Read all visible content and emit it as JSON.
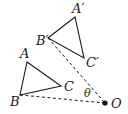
{
  "diagram": {
    "triangles": [
      {
        "name": "original",
        "vertices": [
          {
            "label": "A",
            "x": 27,
            "y": 62,
            "lx": 20,
            "ly": 58
          },
          {
            "label": "B",
            "x": 20,
            "y": 95,
            "lx": 10,
            "ly": 106
          },
          {
            "label": "C",
            "x": 61,
            "y": 86,
            "lx": 64,
            "ly": 91
          }
        ]
      },
      {
        "name": "image",
        "vertices": [
          {
            "label": "A′",
            "x": 75,
            "y": 17,
            "lx": 72,
            "ly": 13
          },
          {
            "label": "B′",
            "x": 48,
            "y": 38,
            "lx": 36,
            "ly": 45
          },
          {
            "label": "C′",
            "x": 84,
            "y": 58,
            "lx": 86,
            "ly": 67
          }
        ]
      }
    ],
    "center": {
      "label": "O",
      "x": 105,
      "y": 103,
      "lx": 111,
      "ly": 108
    },
    "angle": {
      "label": "θ",
      "lx": 85,
      "ly": 96
    },
    "dashed_lines": [
      {
        "from": "B",
        "to": "O"
      },
      {
        "from": "B′",
        "to": "O"
      }
    ]
  }
}
